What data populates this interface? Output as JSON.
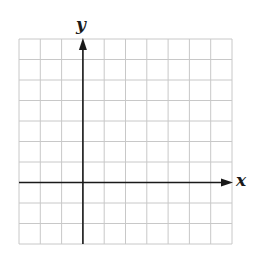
{
  "diagram": {
    "type": "coordinate-grid",
    "grid": {
      "columns": 10,
      "rows": 10,
      "left": 19,
      "top": 39,
      "cell_width": 21.3,
      "cell_height": 20.5,
      "line_color": "#c8c8c8",
      "border_color": "#c8c8c8"
    },
    "axes": {
      "color": "#1a1a1a",
      "y_axis_column": 3,
      "x_axis_row": 7,
      "x_label": "x",
      "y_label": "y"
    }
  }
}
